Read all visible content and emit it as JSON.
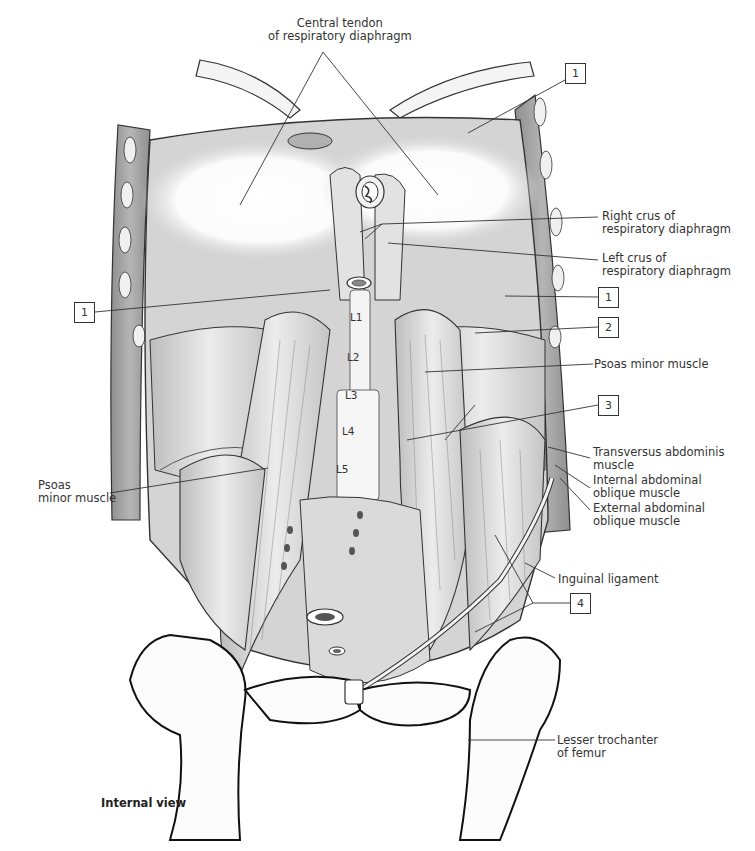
{
  "figure": {
    "view_caption": "Internal view",
    "labels": {
      "central_tendon": [
        "Central tendon",
        "of respiratory diaphragm"
      ],
      "right_crus": [
        "Right crus of",
        "respiratory diaphragm"
      ],
      "left_crus": [
        "Left crus of",
        "respiratory diaphragm"
      ],
      "psoas_minor_right": [
        "Psoas minor muscle"
      ],
      "psoas_minor_left": [
        "Psoas",
        "minor muscle"
      ],
      "transversus": [
        "Transversus abdominis",
        "muscle"
      ],
      "internal_oblique": [
        "Internal abdominal",
        "oblique muscle"
      ],
      "external_oblique": [
        "External abdominal",
        "oblique muscle"
      ],
      "inguinal_ligament": [
        "Inguinal ligament"
      ],
      "lesser_trochanter": [
        "Lesser trochanter",
        "of femur"
      ]
    },
    "number_boxes": [
      {
        "id": "box-1-top",
        "value": "1"
      },
      {
        "id": "box-1-left",
        "value": "1"
      },
      {
        "id": "box-1-right",
        "value": "1"
      },
      {
        "id": "box-2",
        "value": "2"
      },
      {
        "id": "box-3",
        "value": "3"
      },
      {
        "id": "box-4",
        "value": "4"
      }
    ],
    "vertebrae": [
      "L1",
      "L2",
      "L3",
      "L4",
      "L5"
    ],
    "colors": {
      "ink": "#2a2a2a",
      "muscle_fill": "#e4e4e4",
      "muscle_shadow": "#b8b8b8",
      "bone_fill": "#fafafa",
      "wall_fill": "#a8a8a8"
    }
  }
}
